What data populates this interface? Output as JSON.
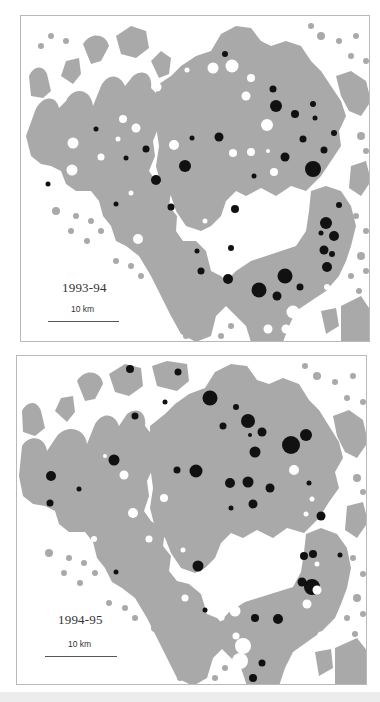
{
  "colors": {
    "land": "#a9a9a9",
    "filled_circle": "#111111",
    "open_circle": "#ffffff",
    "frame": "#b9b9b9"
  },
  "maps": [
    {
      "season": "1993-94",
      "scale_label": "10 km",
      "filled_circles": [
        [
          204,
          38,
          3
        ],
        [
          252,
          73,
          3.5
        ],
        [
          255,
          90,
          6
        ],
        [
          274,
          98,
          4
        ],
        [
          292,
          88,
          3
        ],
        [
          294,
          102,
          2.5
        ],
        [
          313,
          117,
          3
        ],
        [
          282,
          123,
          3.5
        ],
        [
          303,
          134,
          3.5
        ],
        [
          264,
          141,
          4.5
        ],
        [
          292,
          153,
          8
        ],
        [
          233,
          160,
          2.5
        ],
        [
          198,
          121,
          4.5
        ],
        [
          171,
          122,
          2.5
        ],
        [
          164,
          150,
          6
        ],
        [
          125,
          133,
          3.5
        ],
        [
          105,
          142,
          2.5
        ],
        [
          75,
          113,
          2.5
        ],
        [
          27,
          168,
          2.5
        ],
        [
          135,
          164,
          5
        ],
        [
          150,
          191,
          3.5
        ],
        [
          95,
          188,
          2.5
        ],
        [
          214,
          193,
          4
        ],
        [
          210,
          232,
          3
        ],
        [
          176,
          235,
          2.5
        ],
        [
          180,
          255,
          3.5
        ],
        [
          207,
          263,
          5
        ],
        [
          238,
          274,
          7.5
        ],
        [
          264,
          260,
          7.5
        ],
        [
          256,
          280,
          4.5
        ],
        [
          279,
          271,
          3.5
        ],
        [
          318,
          189,
          3
        ],
        [
          305,
          207,
          6
        ],
        [
          313,
          220,
          5
        ],
        [
          300,
          217,
          2.5
        ],
        [
          303,
          234,
          4.5
        ],
        [
          311,
          238,
          3
        ],
        [
          306,
          251,
          5
        ]
      ],
      "open_circles": [
        [
          180,
          25,
          5.5
        ],
        [
          211,
          50,
          6.5
        ],
        [
          192,
          52,
          5.5
        ],
        [
          166,
          54,
          2.5
        ],
        [
          136,
          71,
          4.5
        ],
        [
          230,
          62,
          4
        ],
        [
          225,
          80,
          4.5
        ],
        [
          246,
          109,
          6
        ],
        [
          102,
          103,
          4
        ],
        [
          115,
          112,
          4.5
        ],
        [
          97,
          123,
          2.5
        ],
        [
          153,
          129,
          5
        ],
        [
          212,
          137,
          4
        ],
        [
          230,
          136,
          4
        ],
        [
          247,
          135,
          2
        ],
        [
          52,
          127,
          5.5
        ],
        [
          80,
          141,
          3.5
        ],
        [
          51,
          154,
          5.5
        ],
        [
          253,
          156,
          4
        ],
        [
          110,
          177,
          2.5
        ],
        [
          184,
          205,
          2.5
        ],
        [
          198,
          217,
          4.5
        ],
        [
          117,
          223,
          5
        ],
        [
          306,
          271,
          3
        ],
        [
          272,
          296,
          6.5
        ],
        [
          247,
          313,
          4.5
        ],
        [
          265,
          313,
          4.5
        ]
      ]
    },
    {
      "season": "1994-95",
      "scale_label": "10 km",
      "filled_circles": [
        [
          113,
          13,
          4
        ],
        [
          161,
          16,
          3.5
        ],
        [
          148,
          46,
          2.5
        ],
        [
          118,
          60,
          3.5
        ],
        [
          193,
          42,
          7.5
        ],
        [
          219,
          51,
          3
        ],
        [
          231,
          65,
          7
        ],
        [
          206,
          70,
          3.5
        ],
        [
          233,
          79,
          2
        ],
        [
          245,
          76,
          4.5
        ],
        [
          274,
          89,
          9
        ],
        [
          289,
          79,
          6
        ],
        [
          238,
          96,
          5.5
        ],
        [
          97,
          104,
          5.5
        ],
        [
          179,
          115,
          6.5
        ],
        [
          160,
          114,
          3.5
        ],
        [
          34,
          120,
          5
        ],
        [
          62,
          133,
          2.5
        ],
        [
          33,
          147,
          3.5
        ],
        [
          213,
          127,
          5
        ],
        [
          231,
          126,
          5.5
        ],
        [
          253,
          132,
          4.5
        ],
        [
          236,
          148,
          4.5
        ],
        [
          214,
          152,
          2.5
        ],
        [
          292,
          127,
          2.5
        ],
        [
          304,
          160,
          4.5
        ],
        [
          181,
          210,
          5.5
        ],
        [
          99,
          216,
          2.5
        ],
        [
          287,
          200,
          4
        ],
        [
          296,
          198,
          4
        ],
        [
          323,
          199,
          2.5
        ],
        [
          285,
          226,
          4.5
        ],
        [
          295,
          231,
          8
        ],
        [
          188,
          254,
          2.5
        ],
        [
          238,
          262,
          4
        ],
        [
          261,
          263,
          5
        ],
        [
          245,
          307,
          3.5
        ],
        [
          236,
          322,
          4
        ]
      ],
      "open_circles": [
        [
          187,
          28,
          2.5
        ],
        [
          88,
          100,
          2
        ],
        [
          107,
          119,
          4.5
        ],
        [
          147,
          142,
          4
        ],
        [
          116,
          157,
          5
        ],
        [
          36,
          158,
          2.5
        ],
        [
          277,
          114,
          5
        ],
        [
          295,
          143,
          2.5
        ],
        [
          289,
          158,
          2.5
        ],
        [
          132,
          183,
          3.5
        ],
        [
          77,
          183,
          3
        ],
        [
          166,
          194,
          2.5
        ],
        [
          300,
          208,
          2.5
        ],
        [
          300,
          234,
          4.5
        ],
        [
          193,
          225,
          3.5
        ],
        [
          168,
          242,
          3.5
        ],
        [
          218,
          255,
          5.5
        ],
        [
          226,
          290,
          8
        ],
        [
          223,
          305,
          8
        ],
        [
          219,
          280,
          3.5
        ],
        [
          205,
          262,
          2.5
        ],
        [
          304,
          279,
          3.5
        ],
        [
          290,
          248,
          4.5
        ]
      ]
    }
  ]
}
